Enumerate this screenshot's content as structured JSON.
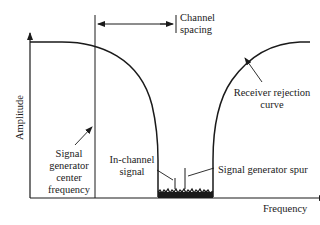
{
  "diagram": {
    "y_axis_label": "Amplitude",
    "x_axis_label": "Frequency",
    "annotations": {
      "channel_spacing": [
        "Channel",
        "spacing"
      ],
      "receiver_rejection_curve": [
        "Receiver rejection",
        "curve"
      ],
      "signal_generator_center_frequency": [
        "Signal",
        "generator",
        "center",
        "frequency"
      ],
      "in_channel_signal": [
        "In-channel",
        "signal"
      ],
      "signal_generator_spur": "Signal generator spur"
    },
    "colors": {
      "line": "#1a1a1a",
      "background": "#ffffff"
    }
  }
}
